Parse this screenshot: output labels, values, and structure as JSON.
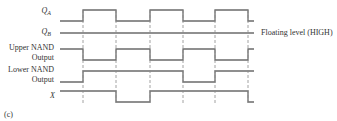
{
  "figure_label": "(c)",
  "annotation": "Floating level (HIGH)",
  "signals": [
    {
      "name": "Q_A",
      "main": "Q",
      "sub": "A",
      "edges": [
        60,
        83,
        116,
        150,
        183,
        215,
        248,
        254
      ],
      "levels": [
        0,
        1,
        0,
        1,
        0,
        1,
        0
      ]
    },
    {
      "name": "Q_B",
      "main": "Q",
      "sub": "B",
      "edges": [
        60,
        254
      ],
      "levels": [
        1
      ]
    },
    {
      "name": "Upper NAND Output",
      "line1": "Upper NAND",
      "line2": "Output",
      "edges": [
        60,
        83,
        116,
        150,
        183,
        215,
        248,
        254
      ],
      "levels": [
        1,
        0,
        1,
        0,
        1,
        0,
        1
      ]
    },
    {
      "name": "Lower NAND Output",
      "line1": "Lower NAND",
      "line2": "Output",
      "edges": [
        60,
        83,
        183,
        215,
        254
      ],
      "levels": [
        0,
        1,
        0,
        1
      ]
    },
    {
      "name": "X",
      "main": "X",
      "edges": [
        60,
        116,
        150,
        248,
        254
      ],
      "levels": [
        1,
        0,
        1,
        0
      ]
    }
  ],
  "clock_edges_x": [
    83,
    116,
    150,
    183,
    215,
    248
  ],
  "colors": {
    "trace": "#6b6b6b",
    "dash": "#8a8a8a",
    "text": "#333333"
  }
}
